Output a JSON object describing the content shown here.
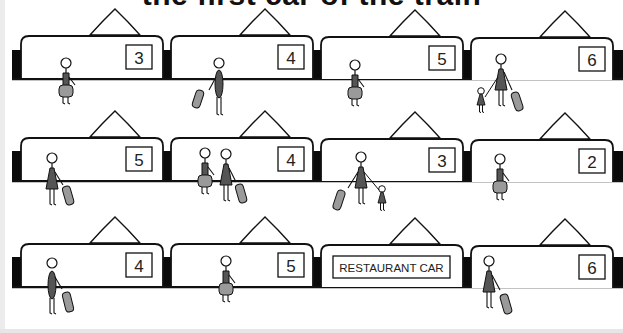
{
  "title": "the first car of the train",
  "colors": {
    "outline": "#111111",
    "coupler": "#0a0a0a",
    "person_dark": "#555555",
    "luggage": "#9a9a9a",
    "background": "#ffffff"
  },
  "rows": [
    {
      "cars": [
        {
          "number": "3",
          "passengers": "person-with-bag"
        },
        {
          "number": "4",
          "passengers": "person-with-suitcase"
        },
        {
          "number": "5",
          "passengers": "person-with-bag"
        },
        {
          "number": "6",
          "passengers": "adult-with-child-and-suitcase"
        }
      ]
    },
    {
      "cars": [
        {
          "number": "5",
          "passengers": "person-with-suitcase"
        },
        {
          "number": "4",
          "passengers": "couple-with-bag-and-suitcase"
        },
        {
          "number": "3",
          "passengers": "adult-with-suitcase-and-child"
        },
        {
          "number": "2",
          "passengers": "person-with-bag"
        }
      ]
    },
    {
      "cars": [
        {
          "number": "4",
          "passengers": "person-with-suitcase"
        },
        {
          "number": "5",
          "passengers": "person-with-bag"
        },
        {
          "number": "RESTAURANT CAR",
          "passengers": "none"
        },
        {
          "number": "6",
          "passengers": "person-with-suitcase"
        }
      ]
    }
  ]
}
